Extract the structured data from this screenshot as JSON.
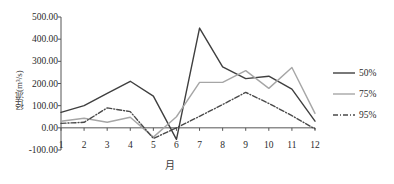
{
  "chart_data": {
    "type": "line",
    "title": "",
    "xlabel": "月",
    "ylabel": "径流(m³/s)",
    "categories": [
      "1",
      "2",
      "3",
      "4",
      "5",
      "6",
      "7",
      "8",
      "9",
      "10",
      "11",
      "12"
    ],
    "x": [
      1,
      2,
      3,
      4,
      5,
      6,
      7,
      8,
      9,
      10,
      11,
      12
    ],
    "ylim": [
      -100,
      500
    ],
    "xlim": [
      1,
      12
    ],
    "yticks": [
      "-100.00",
      "0.00",
      "100.00",
      "200.00",
      "300.00",
      "400.00",
      "500.00"
    ],
    "ytick_values": [
      -100,
      0,
      100,
      200,
      300,
      400,
      500
    ],
    "grid": false,
    "legend_position": "right",
    "series": [
      {
        "name": "50%",
        "color": "#3f3f3f",
        "style": "solid",
        "values": [
          70,
          100,
          155,
          210,
          143,
          -52,
          450,
          275,
          222,
          233,
          175,
          30
        ]
      },
      {
        "name": "75%",
        "color": "#a6a6a6",
        "style": "solid",
        "values": [
          30,
          43,
          25,
          48,
          -42,
          50,
          205,
          205,
          258,
          178,
          272,
          65
        ]
      },
      {
        "name": "95%",
        "color": "#4a4a4a",
        "style": "dashdot",
        "values": [
          20,
          25,
          90,
          73,
          -48,
          0,
          52,
          105,
          160,
          110,
          55,
          -5
        ]
      }
    ]
  },
  "legend": {
    "items": [
      {
        "label": "50%"
      },
      {
        "label": "75%"
      },
      {
        "label": "95%"
      }
    ]
  },
  "axes": {
    "y_title": "径流(m³/s)",
    "x_title": "月"
  }
}
